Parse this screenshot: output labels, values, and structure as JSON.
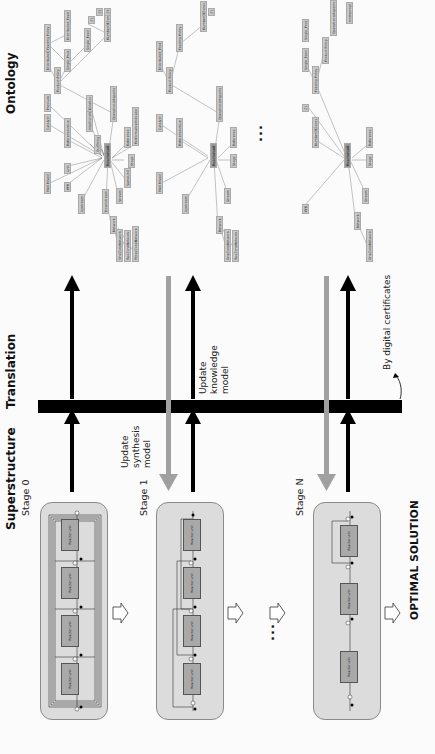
{
  "superstructure": {
    "title": "Superstructure",
    "stages": [
      {
        "label": "Stage 0",
        "units": [
          "Reactor unit",
          "Reactor unit",
          "Reactor unit",
          "Reactor unit"
        ]
      },
      {
        "label": "Stage 1",
        "units": [
          "Reactor unit",
          "Reactor unit",
          "Reactor unit",
          "Reactor unit"
        ]
      },
      {
        "label": "Stage N",
        "units": [
          "Reactor unit",
          "Reactor unit",
          "Reactor unit"
        ]
      }
    ],
    "ellipsis": "...",
    "optimal": "OPTIMAL SOLUTION"
  },
  "translation": {
    "title": "Translation",
    "update_synthesis": [
      "Update",
      "synthesis",
      "model"
    ],
    "update_knowledge": [
      "Update",
      "knowledge",
      "model"
    ],
    "certificates": "By digital certificates"
  },
  "ontology": {
    "title": "Ontology",
    "ellipsis": "...",
    "hub_label": "ReactorUnit",
    "node_labels": [
      "OneZoneNetwork",
      "TwoZoneNetwork",
      "ThreeZoneNetwork",
      "FourZoneNetwork",
      "Network",
      "Downstream",
      "Upstream",
      "OutThing",
      "Stream",
      "Unit",
      "SameUnit",
      "Stage",
      "Reference",
      "PerformanceIndicator",
      "ReferenceValue",
      "Well Mixed",
      "PFR",
      "Z1",
      "Z2",
      "Z3",
      "NumberOfZones",
      "Feeding Policy",
      "Distributed_Feed",
      "Single_Feed",
      "Product Policy",
      "Distributed_Prod",
      "Single_Prod",
      "OperationalAspects",
      "TemperatureProfile",
      "Isothermal",
      "NonIsothermal",
      "Catalyst",
      "InletConditions",
      "Pressure",
      "Kinetics",
      "SequentialConnections",
      "Parallel",
      "Series"
    ]
  },
  "colors": {
    "arrow_black": "#000000",
    "arrow_gray": "#a0a0a0",
    "stage_fill": "#dcdcdc",
    "reactor_fill": "#a9a9a9",
    "node_fill": "#c9c9c9"
  }
}
